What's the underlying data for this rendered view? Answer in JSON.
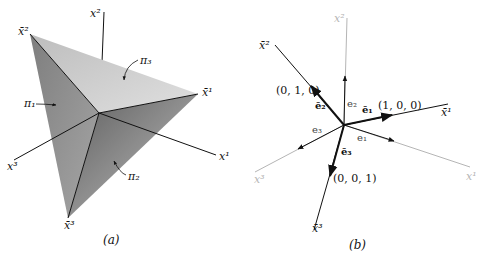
{
  "panel_a": {
    "caption": "(a)",
    "axes": {
      "x1": "x¹",
      "x2": "x²",
      "x3": "x³"
    },
    "vertices": {
      "xbar1": "x̄¹",
      "xbar2": "x̄²",
      "xbar3": "x̄³"
    },
    "planes": {
      "pi1": "π₁",
      "pi2": "π₂",
      "pi3": "π₃"
    },
    "colors": {
      "face_light": "#d2d2d2",
      "face_mid": "#b3b3b3",
      "face_dark": "#8f8f8f",
      "edge": "#111111"
    }
  },
  "panel_b": {
    "caption": "(b)",
    "axes": {
      "x1": "x¹",
      "x2": "x²",
      "x3": "x³",
      "xbar1": "x̄¹",
      "xbar2": "x̄²",
      "xbar3": "x̄³"
    },
    "vectors": {
      "ebar1": "ē₁",
      "ebar2": "ē₂",
      "ebar3": "ē₃",
      "e1": "e₁",
      "e2": "e₂",
      "e3": "e₃"
    },
    "points": {
      "p100": "(1, 0, 0)",
      "p010": "(0, 1, 0)",
      "p001": "(0, 0, 1)"
    },
    "colors": {
      "primary_axis": "#111111",
      "secondary_axis": "#b5b5b5"
    }
  }
}
